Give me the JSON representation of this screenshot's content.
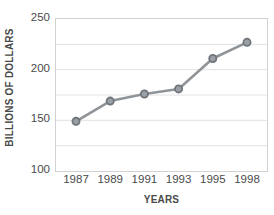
{
  "chart_data": {
    "type": "line",
    "title": "",
    "xlabel": "YEARS",
    "ylabel": "BILLIONS OF DOLLARS",
    "categories": [
      "1987",
      "1989",
      "1991",
      "1993",
      "1995",
      "1998"
    ],
    "values": [
      149,
      169,
      176,
      181,
      211,
      227
    ],
    "series": [
      {
        "name": "",
        "values": [
          149,
          169,
          176,
          181,
          211,
          227
        ]
      }
    ],
    "ylim": [
      100,
      250
    ],
    "y_major_ticks": [
      100,
      150,
      200,
      250
    ],
    "y_minor_gridlines": [
      125,
      175,
      225
    ],
    "y_tick_labels": [
      "100",
      "150",
      "200",
      "250"
    ],
    "grid": true,
    "grid_axis": "y",
    "legend": "none",
    "marker": "circle",
    "colors": {
      "line": "#8f9499",
      "marker_fill": "#9aa0a5",
      "marker_edge": "#6f757a",
      "grid": "#e2e2e2",
      "frame": "#d2d2d2",
      "text": "#4a4a4a",
      "background": "#ffffff"
    }
  }
}
